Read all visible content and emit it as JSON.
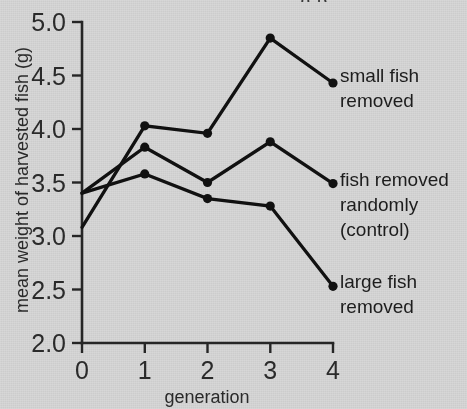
{
  "figure": {
    "background_color": "#d7d7d7",
    "ink_color": "#111111",
    "cropped_header_fragment": "g p"
  },
  "axes": {
    "x": {
      "label": "generation",
      "ticks": [
        "0",
        "1",
        "2",
        "3",
        "4"
      ],
      "range": [
        0,
        4
      ]
    },
    "y": {
      "label": "mean weight of harvested fish (g)",
      "ticks": [
        "2.0",
        "2.5",
        "3.0",
        "3.5",
        "4.0",
        "4.5",
        "5.0"
      ],
      "range": [
        2.0,
        5.0
      ]
    }
  },
  "series_labels": {
    "small_fish_line1": "small fish",
    "small_fish_line2": "removed",
    "control_line1": "fish removed",
    "control_line2": "randomly",
    "control_line3": "(control)",
    "large_fish_line1": "large fish",
    "large_fish_line2": "removed"
  },
  "chart_data": {
    "type": "line",
    "title": "",
    "xlabel": "generation",
    "ylabel": "mean weight of harvested fish (g)",
    "x": [
      0,
      1,
      2,
      3,
      4
    ],
    "xlim": [
      0,
      4
    ],
    "ylim": [
      2.0,
      5.0
    ],
    "grid": false,
    "legend_position": "right-of-plot (inline end-of-line labels)",
    "marker": "filled circle",
    "line_color": "#111111",
    "series": [
      {
        "name": "small fish removed",
        "values": [
          3.08,
          4.03,
          3.96,
          4.85,
          4.43
        ]
      },
      {
        "name": "fish removed randomly (control)",
        "values": [
          3.4,
          3.83,
          3.5,
          3.88,
          3.49
        ]
      },
      {
        "name": "large fish removed",
        "values": [
          3.4,
          3.58,
          3.35,
          3.28,
          2.53
        ]
      }
    ],
    "annotations": [
      "Generation 0: small-fish-removed group starts lowest (3.08); the control and large-fish-removed groups both start at 3.40.",
      "Generation 4: small fish removed = 4.43, control = 3.49, large fish removed = 2.53."
    ]
  }
}
